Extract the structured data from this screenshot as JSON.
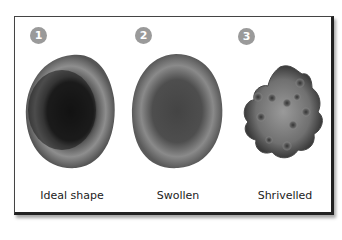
{
  "figure": {
    "panels": [
      {
        "number": "1",
        "label": "Ideal shape",
        "state": "ideal"
      },
      {
        "number": "2",
        "label": "Swollen",
        "state": "swollen"
      },
      {
        "number": "3",
        "label": "Shrivelled",
        "state": "shrivelled"
      }
    ]
  },
  "colors": {
    "badge": "#9a9a9a",
    "cell_light": "#8a8a8a",
    "cell_dark": "#1a1a1a",
    "frame": "#222222"
  }
}
